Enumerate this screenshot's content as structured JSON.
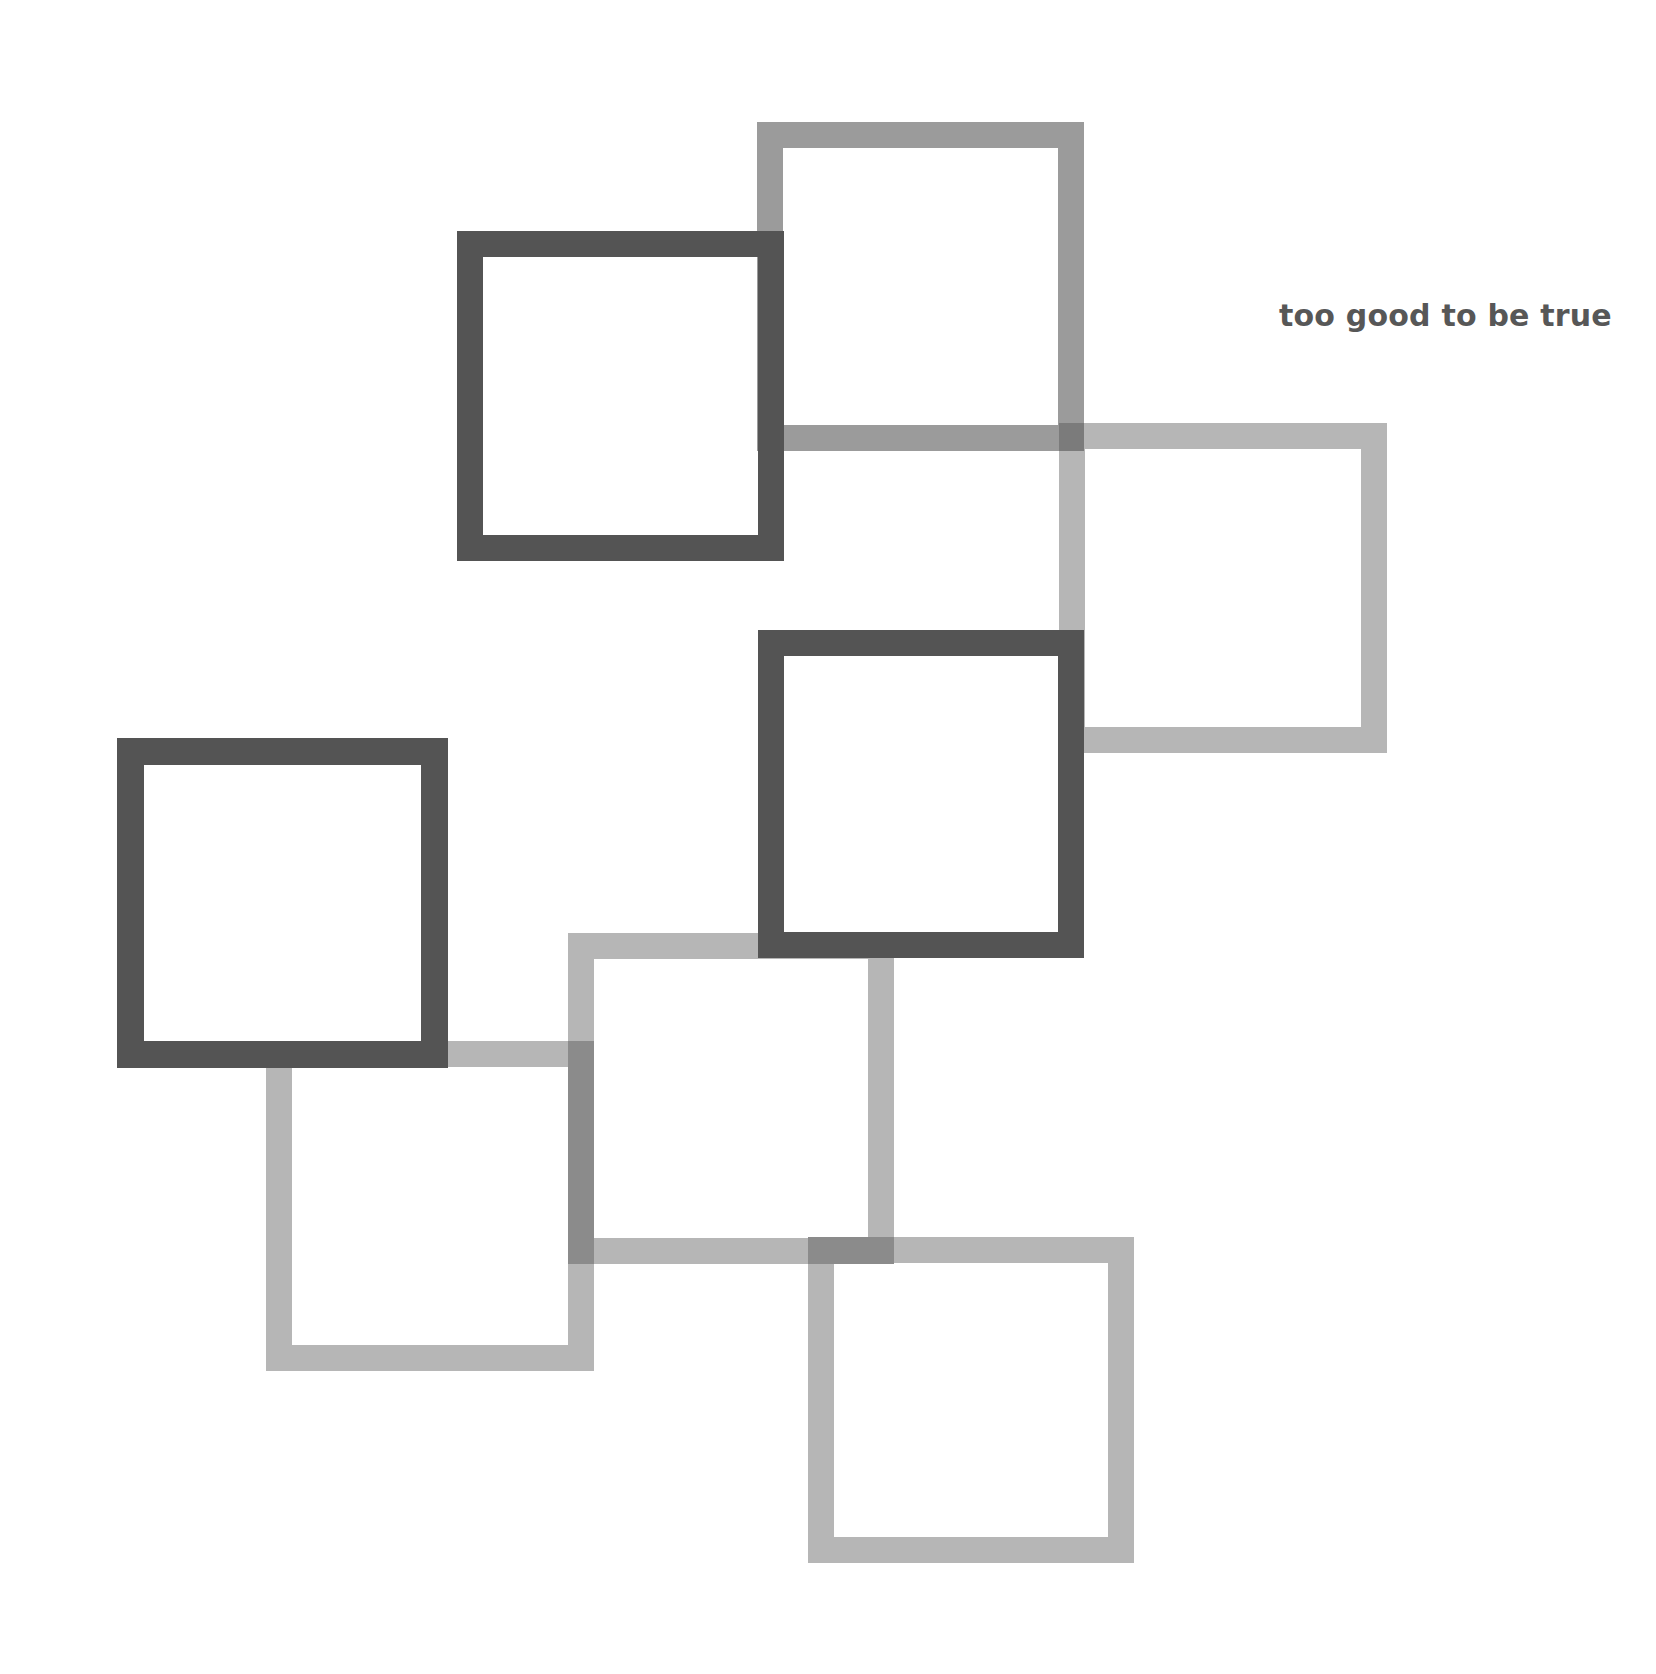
{
  "caption": {
    "text": "too good to be true",
    "color": "#575757"
  },
  "colors": {
    "dark": "#545454",
    "medium": "#9b9b9b",
    "light": "#b6b6b6",
    "overlap_medium_light": "#7b7b7b",
    "overlap_light_light": "#8b8b8b"
  },
  "squares": [
    {
      "id": "A",
      "tone": "dark",
      "x": 457,
      "y": 231,
      "w": 327,
      "h": 330,
      "border": 26
    },
    {
      "id": "B",
      "tone": "medium",
      "x": 757,
      "y": 122,
      "w": 327,
      "h": 329,
      "border": 26
    },
    {
      "id": "C",
      "tone": "light",
      "x": 1059,
      "y": 423,
      "w": 328,
      "h": 330,
      "border": 26
    },
    {
      "id": "D",
      "tone": "dark",
      "x": 758,
      "y": 630,
      "w": 326,
      "h": 328,
      "border": 26
    },
    {
      "id": "E",
      "tone": "dark",
      "x": 117,
      "y": 738,
      "w": 331,
      "h": 330,
      "border": 27
    },
    {
      "id": "F",
      "tone": "light",
      "x": 266,
      "y": 1041,
      "w": 328,
      "h": 330,
      "border": 26
    },
    {
      "id": "G",
      "tone": "light",
      "x": 568,
      "y": 933,
      "w": 326,
      "h": 331,
      "border": 26
    },
    {
      "id": "H",
      "tone": "light",
      "x": 808,
      "y": 1237,
      "w": 326,
      "h": 326,
      "border": 26
    }
  ],
  "overlaps": [
    {
      "id": "B-C",
      "x": 1059,
      "y": 423,
      "w": 25,
      "h": 28,
      "tone": "overlap_medium_light"
    },
    {
      "id": "F-G",
      "x": 568,
      "y": 1041,
      "w": 26,
      "h": 223,
      "tone": "overlap_light_light"
    },
    {
      "id": "G-H",
      "x": 808,
      "y": 1237,
      "w": 86,
      "h": 27,
      "tone": "overlap_light_light"
    }
  ]
}
